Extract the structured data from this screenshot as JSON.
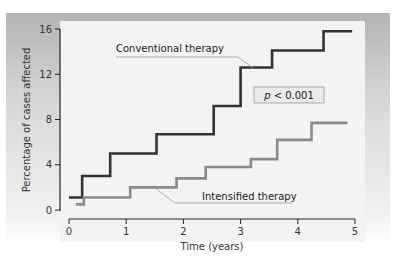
{
  "chart_data": {
    "type": "line",
    "subtype": "step",
    "title": "",
    "xlabel": "Time (years)",
    "ylabel": "Percentage of cases affected",
    "xlim": [
      0,
      5
    ],
    "ylim": [
      0,
      16
    ],
    "xticks": [
      "0",
      "1",
      "2",
      "3",
      "4",
      "5"
    ],
    "yticks": [
      "0",
      "4",
      "8",
      "12",
      "16"
    ],
    "grid": false,
    "series": [
      {
        "name": "Conventional therapy",
        "color": "#333333",
        "x": [
          0,
          0.23,
          0.72,
          1.53,
          2.53,
          3.0,
          3.55,
          4.45,
          4.95
        ],
        "y": [
          1.1,
          3.0,
          5.0,
          6.7,
          9.2,
          12.6,
          14.1,
          15.8,
          15.8
        ]
      },
      {
        "name": "Intensified therapy",
        "color": "#8a8a8a",
        "x": [
          0.12,
          0.26,
          1.07,
          1.88,
          2.39,
          3.18,
          3.64,
          4.24,
          4.87
        ],
        "y": [
          0.5,
          1.1,
          2.0,
          2.8,
          3.8,
          4.5,
          6.2,
          7.7,
          7.7
        ]
      }
    ],
    "annotations": [
      {
        "text": "Conventional therapy",
        "target_series": "Conventional therapy"
      },
      {
        "text": "p < 0.001",
        "boxed": true
      },
      {
        "text": "Intensified therapy",
        "target_series": "Intensified therapy"
      }
    ]
  },
  "labels": {
    "xlabel": "Time (years)",
    "ylabel": "Percentage of cases affected",
    "conventional": "Conventional therapy",
    "intensified": "Intensified therapy",
    "p_italic": "p",
    "p_rest": " < 0.001"
  }
}
